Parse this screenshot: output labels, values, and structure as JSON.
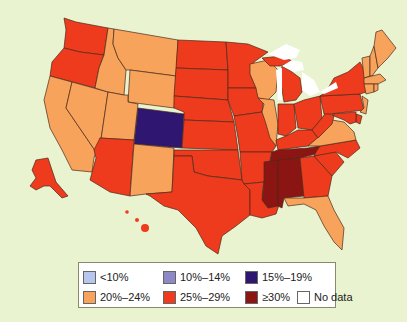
{
  "map": {
    "type": "choropleth",
    "region": "United States",
    "background": "#eaf3cf",
    "lakes_color": "#ffffff",
    "categories": {
      "lt10": "#b7c6ec",
      "c10_14": "#8c89c6",
      "c15_19": "#2f1670",
      "c20_24": "#f7a35c",
      "c25_29": "#ee3a1d",
      "gte30": "#8b1512",
      "nodata": "#ffffff"
    },
    "states": {
      "WA": "c25_29",
      "OR": "c25_29",
      "CA": "c20_24",
      "NV": "c20_24",
      "ID": "c20_24",
      "MT": "c20_24",
      "WY": "c20_24",
      "UT": "c20_24",
      "CO": "c15_19",
      "AZ": "c25_29",
      "NM": "c20_24",
      "ND": "c25_29",
      "SD": "c25_29",
      "NE": "c25_29",
      "KS": "c25_29",
      "OK": "c25_29",
      "TX": "c25_29",
      "MN": "c25_29",
      "IA": "c25_29",
      "MO": "c25_29",
      "AR": "c25_29",
      "LA": "c25_29",
      "WI": "c20_24",
      "IL": "c20_24",
      "MI": "c25_29",
      "IN": "c25_29",
      "OH": "c25_29",
      "KY": "c25_29",
      "TN": "gte30",
      "MS": "gte30",
      "AL": "gte30",
      "GA": "c25_29",
      "FL": "c20_24",
      "SC": "c25_29",
      "NC": "c25_29",
      "VA": "c20_24",
      "WV": "c25_29",
      "PA": "c25_29",
      "NY": "c25_29",
      "NJ": "c20_24",
      "DE": "c25_29",
      "MD": "c25_29",
      "CT": "c20_24",
      "RI": "c20_24",
      "MA": "c20_24",
      "VT": "c20_24",
      "NH": "c20_24",
      "ME": "c20_24",
      "AK": "c25_29",
      "HI": "c25_29"
    }
  },
  "legend": {
    "items": [
      {
        "label": "<10%",
        "color": "#b7c6ec"
      },
      {
        "label": "10%–14%",
        "color": "#8c89c6"
      },
      {
        "label": "15%–19%",
        "color": "#2f1670"
      },
      {
        "label": "20%–24%",
        "color": "#f7a35c"
      },
      {
        "label": "25%–29%",
        "color": "#ee3a1d"
      },
      {
        "label": "≥30%",
        "color": "#8b1512"
      },
      {
        "label": "No data",
        "color": "#ffffff"
      }
    ]
  }
}
